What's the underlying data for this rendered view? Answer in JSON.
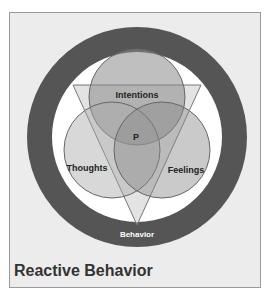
{
  "diagram": {
    "title": "Reactive Behavior",
    "labels": {
      "top": "Intentions",
      "left": "Thoughts",
      "right": "Feelings",
      "center": "P",
      "bottom": "Behavior"
    },
    "colors": {
      "background": "#ececec",
      "ring": "#555555",
      "inner": "#ffffff",
      "circle_fill": "#8a8a8a",
      "triangle_fill": "#c8c8c8",
      "title": "#333333"
    }
  }
}
